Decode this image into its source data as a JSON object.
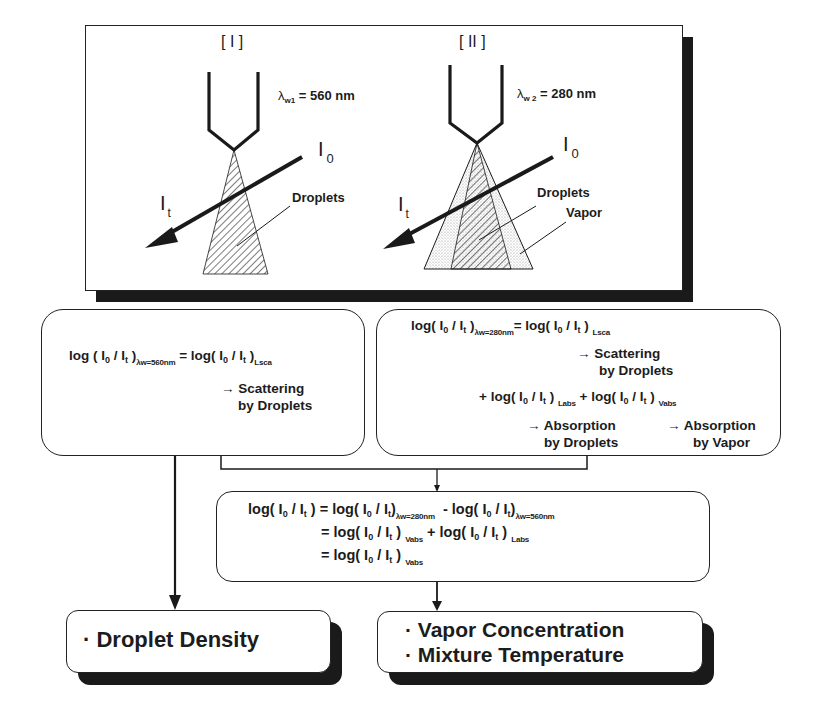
{
  "diagram": {
    "top_panel": {
      "case_1": {
        "label": "[ I ]",
        "wavelength_symbol": "λ",
        "wavelength_sub": "w1",
        "wavelength_value": "= 560 nm",
        "incident_intensity": "I",
        "incident_sub": "0",
        "transmitted_intensity": "I",
        "transmitted_sub": "t",
        "spray_label": "Droplets"
      },
      "case_2": {
        "label": "[ II ]",
        "wavelength_symbol": "λ",
        "wavelength_sub": "w 2",
        "wavelength_value": "= 280 nm",
        "incident_intensity": "I",
        "incident_sub": "0",
        "transmitted_intensity": "I",
        "transmitted_sub": "t",
        "spray_label": "Droplets",
        "vapor_label": "Vapor"
      }
    },
    "left_equation_box": {
      "lhs": "log ( I",
      "lhs_sub0": "0",
      "lhs_mid": " / I",
      "lhs_subt": "t",
      "lhs_close": " )",
      "lhs_cond": "λw=560nm",
      "rhs": "= log( I",
      "rhs_sub0": "0",
      "rhs_mid": " / I",
      "rhs_subt": "t",
      "rhs_close": " )",
      "rhs_cond": "Lsca",
      "note_line1": "→ Scattering",
      "note_line2": "by Droplets"
    },
    "right_equation_box": {
      "line1_lhs": "log( I",
      "line1_cond": "λw=280nm",
      "line1_rhs": "= log( I",
      "line1_rhs_cond": "Lsca",
      "note1_line1": "→ Scattering",
      "note1_line2": "by Droplets",
      "line2_a": "+ log( I",
      "line2_a_cond": "Labs",
      "line2_b": "+ log( I",
      "line2_b_cond": "Vabs",
      "note2_line1": "→ Absorption",
      "note2_line2": "by Droplets",
      "note3_line1": "→ Absorption",
      "note3_line2": "by Vapor",
      "sub0": "0",
      "subt": "t",
      "slash": " / I",
      "close": " )"
    },
    "lower_equation_box": {
      "line1_lhs": "log( I",
      "line1_eq": ") = log( I",
      "line1_cond_a": "λw=280nm",
      "line1_minus": "-  log( I",
      "line1_cond_b": "λw=560nm",
      "line2": "= log( I",
      "line2_cond_a": "Vabs",
      "line2_plus": "+  log( I",
      "line2_cond_b": "Labs",
      "line3": "= log( I",
      "line3_cond": "Vabs",
      "sub0": "0",
      "subt": "t",
      "slash": " / I",
      "close": " )"
    },
    "outputs": {
      "left": "· Droplet Density",
      "right_line1": "· Vapor Concentration",
      "right_line2": "· Mixture Temperature"
    },
    "colors": {
      "ink": "#1a1a1a",
      "background": "#ffffff",
      "shadow": "#1a1a1a",
      "vapor_stipple": "#bdbdbd"
    }
  }
}
